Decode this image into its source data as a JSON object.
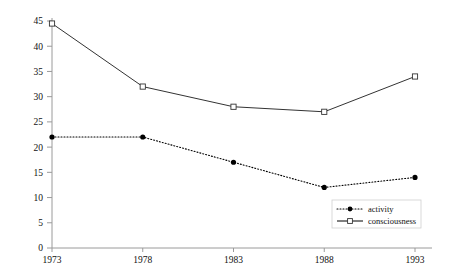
{
  "chart_data": {
    "type": "line",
    "title": "",
    "xlabel": "",
    "ylabel": "",
    "categories": [
      "1973",
      "1978",
      "1983",
      "1988",
      "1993"
    ],
    "x": [
      1973,
      1978,
      1983,
      1988,
      1993
    ],
    "xlim": [
      1973,
      1993
    ],
    "ylim": [
      0,
      45
    ],
    "yticks": [
      0,
      5,
      10,
      15,
      20,
      25,
      30,
      35,
      40,
      45
    ],
    "ytick_labels": [
      "0",
      "5",
      "10",
      "15",
      "20",
      "25",
      "30",
      "35",
      "40",
      "45"
    ],
    "grid": false,
    "legend_position": "bottom-right",
    "series": [
      {
        "name": "activity",
        "values": [
          22,
          22,
          17,
          12,
          14
        ],
        "line_style": "dotted",
        "marker": "filled-circle",
        "color": "#000000"
      },
      {
        "name": "consciousness",
        "values": [
          44.5,
          32,
          28,
          27,
          34
        ],
        "line_style": "solid",
        "marker": "open-square",
        "color": "#333333"
      }
    ]
  },
  "axes": {
    "y_tick_labels": [
      "45",
      "40",
      "35",
      "30",
      "25",
      "20",
      "15",
      "10",
      "5",
      "0"
    ],
    "x_tick_labels": [
      "1973",
      "1978",
      "1983",
      "1988",
      "1993"
    ]
  },
  "legend": {
    "items": [
      {
        "label": "activity",
        "style": "dotted",
        "marker": "filled-circle"
      },
      {
        "label": "consciousness",
        "style": "solid",
        "marker": "open-square"
      }
    ]
  },
  "colors": {
    "axis": "#9a9a9a",
    "series_activity": "#000000",
    "series_consciousness": "#333333",
    "legend_border": "#cfcfcf",
    "background": "#ffffff"
  }
}
